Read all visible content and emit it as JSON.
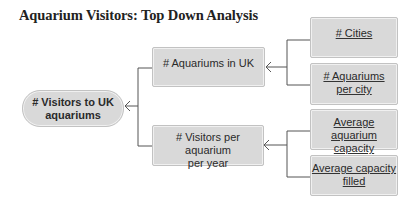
{
  "title": "Aquarium Visitors: Top Down Analysis",
  "colors": {
    "node_fill": "#d9d9d9",
    "node_border": "#c2c2c2",
    "connector": "#555555",
    "text": "#2a2a2a"
  },
  "diagram": {
    "type": "tree",
    "direction": "right-to-left",
    "root": {
      "label": "# Visitors to UK aquariums",
      "line1": "# Visitors to UK",
      "line2": "aquariums",
      "children": [
        {
          "label": "# Aquariums in UK",
          "children": [
            {
              "label": "# Cities",
              "underlined": true
            },
            {
              "label": "# Aquariums per city",
              "line1": "# Aquariums",
              "line2": "per city",
              "underlined": true
            }
          ]
        },
        {
          "label": "# Visitors per aquarium per year",
          "line1": "# Visitors per aquarium",
          "line2": "per year",
          "children": [
            {
              "label": "Average aquarium capacity",
              "line1": "Average aquarium",
              "line2": "capacity",
              "underlined": true
            },
            {
              "label": "Average capacity filled",
              "line1": "Average capacity",
              "line2": "filled",
              "underlined": true
            }
          ]
        }
      ]
    }
  }
}
